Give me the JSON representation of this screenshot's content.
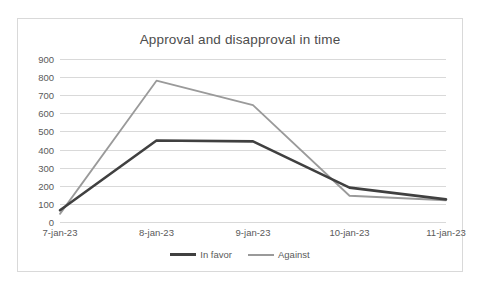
{
  "chart_data": {
    "type": "line",
    "title": "Approval and disapproval in time",
    "xlabel": "",
    "ylabel": "",
    "categories": [
      "7-jan-23",
      "8-jan-23",
      "9-jan-23",
      "10-jan-23",
      "11-jan-23"
    ],
    "series": [
      {
        "name": "In favor",
        "values": [
          65,
          450,
          445,
          190,
          125
        ],
        "color": "#404040"
      },
      {
        "name": "Against",
        "values": [
          45,
          780,
          645,
          145,
          120
        ],
        "color": "#9a9a9a"
      }
    ],
    "ylim": [
      0,
      900
    ],
    "ytick_values": [
      0,
      100,
      200,
      300,
      400,
      500,
      600,
      700,
      800,
      900
    ],
    "ytick_labels": [
      "0",
      "100",
      "200",
      "300",
      "400",
      "500",
      "600",
      "700",
      "800",
      "900"
    ],
    "grid": true,
    "legend_position": "bottom"
  },
  "legend": {
    "items": [
      {
        "label": "In favor"
      },
      {
        "label": "Against"
      }
    ]
  }
}
